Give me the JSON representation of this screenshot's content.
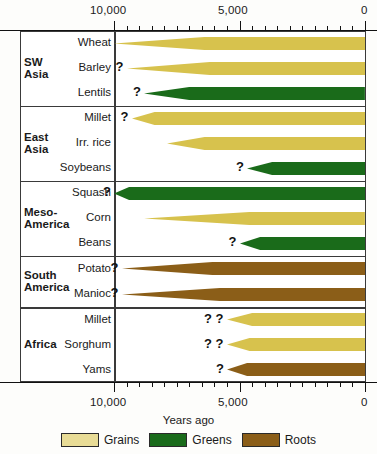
{
  "chart_data": {
    "type": "bar",
    "title": "",
    "xlabel": "Years ago",
    "ylabel": "",
    "xlim": [
      10500,
      0
    ],
    "axis_direction": "reversed",
    "grid": false,
    "legend_position": "bottom",
    "tick_labels_top": [
      "10,000",
      "5,000",
      "0"
    ],
    "tick_labels_bottom": [
      "10,000",
      "5,000",
      "0"
    ],
    "tick_values": [
      10000,
      5000,
      0
    ],
    "minor_tick_interval": 500,
    "legend": [
      {
        "label": "Grains",
        "color": "#e3d78f"
      },
      {
        "label": "Greens",
        "color": "#166b16"
      },
      {
        "label": "Roots",
        "color": "#8a5c16"
      }
    ],
    "colors": {
      "grains_fill": "#d7c24d",
      "grains_legend_fill": "#e8dc96",
      "greens_fill": "#1a6b1a",
      "roots_fill": "#8b5e18",
      "frame": "#3a3a3a",
      "background": "#ffffff"
    },
    "groups": [
      {
        "region": "SW\nAsia",
        "rows": [
          {
            "crop": "Wheat",
            "category": "Grains",
            "start_years_ago": 10000,
            "full_width_years_ago": 6400,
            "uncertain": "",
            "uncertainty_marks": 0
          },
          {
            "crop": "Barley",
            "category": "Grains",
            "start_years_ago": 9500,
            "full_width_years_ago": 6200,
            "uncertain": "?",
            "uncertainty_marks": 1
          },
          {
            "crop": "Lentils",
            "category": "Greens",
            "start_years_ago": 8800,
            "full_width_years_ago": 7000,
            "uncertain": "?",
            "uncertainty_marks": 1
          }
        ]
      },
      {
        "region": "East\nAsia",
        "rows": [
          {
            "crop": "Millet",
            "category": "Grains",
            "start_years_ago": 9300,
            "full_width_years_ago": 8400,
            "uncertain": "?",
            "uncertainty_marks": 1
          },
          {
            "crop": "Irr. rice",
            "category": "Grains",
            "start_years_ago": 7900,
            "full_width_years_ago": 6400,
            "uncertain": "",
            "uncertainty_marks": 0
          },
          {
            "crop": "Soybeans",
            "category": "Greens",
            "start_years_ago": 4700,
            "full_width_years_ago": 3700,
            "uncertain": "?",
            "uncertainty_marks": 1
          }
        ]
      },
      {
        "region": "Meso-\nAmerica",
        "rows": [
          {
            "crop": "Squash",
            "category": "Greens",
            "start_years_ago": 10000,
            "full_width_years_ago": 9400,
            "uncertain": "?",
            "uncertainty_marks": 1
          },
          {
            "crop": "Corn",
            "category": "Grains",
            "start_years_ago": 8800,
            "full_width_years_ago": 4600,
            "uncertain": "",
            "uncertainty_marks": 0
          },
          {
            "crop": "Beans",
            "category": "Greens",
            "start_years_ago": 5000,
            "full_width_years_ago": 4200,
            "uncertain": "?",
            "uncertainty_marks": 1
          }
        ]
      },
      {
        "region": "South\nAmerica",
        "rows": [
          {
            "crop": "Potato",
            "category": "Roots",
            "start_years_ago": 9700,
            "full_width_years_ago": 6100,
            "uncertain": "?",
            "uncertainty_marks": 1
          },
          {
            "crop": "Manioc",
            "category": "Roots",
            "start_years_ago": 9700,
            "full_width_years_ago": 5800,
            "uncertain": "?",
            "uncertainty_marks": 1
          }
        ]
      },
      {
        "region": "Africa",
        "rows": [
          {
            "crop": "Millet",
            "category": "Grains",
            "start_years_ago": 5500,
            "full_width_years_ago": 4500,
            "uncertain": "? ?",
            "uncertainty_marks": 2
          },
          {
            "crop": "Sorghum",
            "category": "Grains",
            "start_years_ago": 5500,
            "full_width_years_ago": 4600,
            "uncertain": "? ?",
            "uncertainty_marks": 2
          },
          {
            "crop": "Yams",
            "category": "Roots",
            "start_years_ago": 5500,
            "full_width_years_ago": 4700,
            "uncertain": "?",
            "uncertainty_marks": 1
          }
        ]
      }
    ]
  }
}
